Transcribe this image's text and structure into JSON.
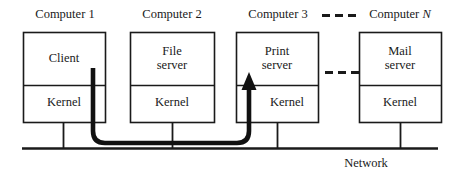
{
  "diagram": {
    "title_labels": [
      {
        "text": "Computer 1",
        "x": 24,
        "y": 8,
        "w": 82
      },
      {
        "text": "Computer 2",
        "x": 131,
        "y": 8,
        "w": 82
      },
      {
        "text": "Computer 3",
        "x": 237,
        "y": 8,
        "w": 82
      },
      {
        "text": "Computer ",
        "italic": "N",
        "x": 359,
        "y": 8,
        "w": 82
      }
    ],
    "nodes": [
      {
        "name": "computer-1",
        "x": 23,
        "y": 32,
        "w": 82,
        "h": 90,
        "divider_y": 85,
        "upper_label": "Client",
        "lower_label": "Kernel",
        "stub_x": 63
      },
      {
        "name": "computer-2",
        "x": 130,
        "y": 32,
        "w": 84,
        "h": 90,
        "divider_y": 85,
        "upper_label": "File\nserver",
        "upper_line1": "File",
        "upper_line2": "server",
        "lower_label": "Kernel",
        "stub_x": 172
      },
      {
        "name": "computer-3",
        "x": 236,
        "y": 32,
        "w": 82,
        "h": 90,
        "divider_y": 85,
        "upper_label": "Print\nserver",
        "upper_line1": "Print",
        "upper_line2": "server",
        "lower_label": "Kernel",
        "stub_x": 277
      },
      {
        "name": "computer-n",
        "x": 359,
        "y": 32,
        "w": 82,
        "h": 90,
        "divider_y": 85,
        "upper_line1": "Mail",
        "upper_line2": "server",
        "lower_label": "Kernel",
        "stub_x": 400
      }
    ],
    "ellipsis_header": {
      "x": 322,
      "y": 14,
      "count": 3
    },
    "ellipsis_boxes": {
      "x": 325,
      "y": 71,
      "count": 3
    },
    "network": {
      "label": "Network",
      "label_x": 330,
      "label_y": 157,
      "line_x1": 22,
      "line_x2": 438,
      "line_y": 148
    },
    "message_arrow": {
      "from_node": "computer-1",
      "to_node": "computer-3",
      "start_x": 93,
      "start_y": 68,
      "bend_y": 143,
      "end_x": 249,
      "end_y": 74,
      "stroke_width": 4.5
    },
    "colors": {
      "ink": "#1a1a1a",
      "background": "#ffffff",
      "arrow": "#111111"
    }
  }
}
